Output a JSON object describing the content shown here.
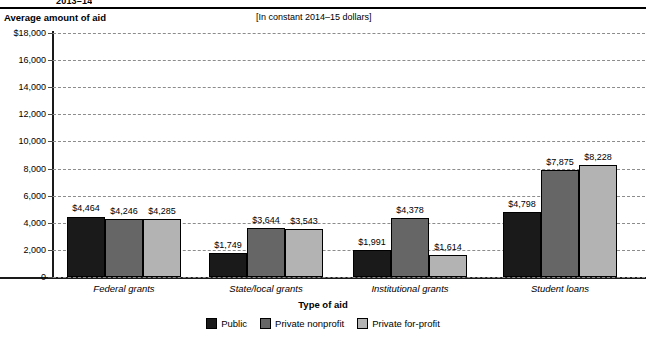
{
  "header": {
    "clipped_title": "2013–14",
    "y_axis_title": "Average amount of aid",
    "units_note": "[In constant 2014–15 dollars]"
  },
  "footer": {
    "x_axis_title": "Type of aid"
  },
  "chart_data": {
    "type": "bar",
    "title": "Average amount of aid",
    "subtitle": "[In constant 2014–15 dollars]",
    "xlabel": "Type of aid",
    "ylabel": "Average amount of aid",
    "ylim": [
      0,
      18000
    ],
    "ytick_values": [
      0,
      2000,
      4000,
      6000,
      8000,
      10000,
      12000,
      14000,
      16000,
      18000
    ],
    "ytick_labels": [
      "0",
      "2,000",
      "4,000",
      "6,000",
      "8,000",
      "10,000",
      "12,000",
      "14,000",
      "16,000",
      "$18,000"
    ],
    "grid": true,
    "legend_position": "bottom",
    "categories": [
      "Federal grants",
      "State/local grants",
      "Institutional grants",
      "Student loans"
    ],
    "series": [
      {
        "name": "Public",
        "color": "#1a1a1a",
        "values": [
          4464,
          4246,
          1991,
          4798
        ],
        "labels": [
          "$4,464",
          "$4,246",
          "$1,991",
          "$4,798"
        ]
      },
      {
        "name": "Private nonprofit",
        "color": "#666666",
        "values": [
          4246,
          3644,
          4378,
          7875
        ],
        "labels": [
          "$4,246",
          "$3,644",
          "$4,378",
          "$7,875"
        ]
      },
      {
        "name": "Private for-profit",
        "color": "#b3b3b3",
        "values": [
          4285,
          3543,
          1614,
          8228
        ],
        "labels": [
          "$4,285",
          "$3,543",
          "$1,614",
          "$8,228"
        ]
      }
    ],
    "group_values": {
      "Federal grants": {
        "Public": 4464,
        "Private nonprofit": 4246,
        "Private for-profit": 4285
      },
      "State/local grants": {
        "Public": 1749,
        "Private nonprofit": 3644,
        "Private for-profit": 3543
      },
      "Institutional grants": {
        "Public": 1991,
        "Private nonprofit": 4378,
        "Private for-profit": 1614
      },
      "Student loans": {
        "Public": 4798,
        "Private nonprofit": 7875,
        "Private for-profit": 8228
      }
    },
    "bars": [
      {
        "group": "Federal grants",
        "series": "Public",
        "value": 4464,
        "label": "$4,464"
      },
      {
        "group": "Federal grants",
        "series": "Private nonprofit",
        "value": 4246,
        "label": "$4,246"
      },
      {
        "group": "Federal grants",
        "series": "Private for-profit",
        "value": 4285,
        "label": "$4,285"
      },
      {
        "group": "State/local grants",
        "series": "Public",
        "value": 1749,
        "label": "$1,749"
      },
      {
        "group": "State/local grants",
        "series": "Private nonprofit",
        "value": 3644,
        "label": "$3,644"
      },
      {
        "group": "State/local grants",
        "series": "Private for-profit",
        "value": 3543,
        "label": "$3,543"
      },
      {
        "group": "Institutional grants",
        "series": "Public",
        "value": 1991,
        "label": "$1,991"
      },
      {
        "group": "Institutional grants",
        "series": "Private nonprofit",
        "value": 4378,
        "label": "$4,378"
      },
      {
        "group": "Institutional grants",
        "series": "Private for-profit",
        "value": 1614,
        "label": "$1,614"
      },
      {
        "group": "Student loans",
        "series": "Public",
        "value": 4798,
        "label": "$4,798"
      },
      {
        "group": "Student loans",
        "series": "Private nonprofit",
        "value": 7875,
        "label": "$7,875"
      },
      {
        "group": "Student loans",
        "series": "Private for-profit",
        "value": 8228,
        "label": "$8,228"
      }
    ]
  },
  "colors": {
    "public": "#1a1a1a",
    "private_nonprofit": "#666666",
    "private_for_profit": "#b3b3b3",
    "gridline": "#8c8c8c",
    "axis": "#1a1a1a"
  }
}
